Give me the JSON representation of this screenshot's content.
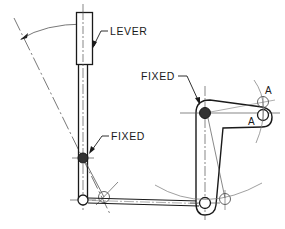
{
  "diagram": {
    "type": "mechanical-linkage-drawing",
    "labels": {
      "lever": "LEVER",
      "fixed_left": "FIXED",
      "fixed_right": "FIXED",
      "a_upper": "A",
      "a_lower": "A"
    },
    "colors": {
      "line": "#1a1a1a",
      "thin_line": "#555555",
      "pivot_fill": "#333333",
      "background": "#ffffff"
    }
  }
}
